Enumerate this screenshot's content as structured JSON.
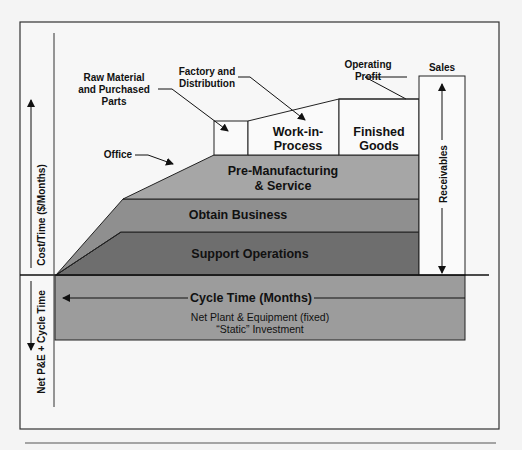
{
  "diagram": {
    "type": "cost-structure-diagram",
    "axis": {
      "upper_label": "Cost/Time ($/Months)",
      "lower_label": "Net P&E + Cycle Time"
    },
    "layers": [
      {
        "name": "Support Operations",
        "color": "#6e6e6e"
      },
      {
        "name": "Obtain Business",
        "color": "#8f8f8f"
      },
      {
        "name": "Pre-Manufacturing",
        "name_line2": "& Service",
        "color": "#a6a6a6"
      }
    ],
    "boxes": {
      "wip": {
        "line1": "Work-in-",
        "line2": "Process"
      },
      "finished": {
        "line1": "Finished",
        "line2": "Goods"
      },
      "receivables": "Receivables"
    },
    "callouts": {
      "raw_material": {
        "line1": "Raw Material",
        "line2": "and Purchased",
        "line3": "Parts"
      },
      "factory": {
        "line1": "Factory and",
        "line2": "Distribution"
      },
      "operating_profit": {
        "line1": "Operating",
        "line2": "Profit"
      },
      "sales": "Sales",
      "office": "Office"
    },
    "bottom": {
      "cycle_time": "Cycle Time (Months)",
      "line1": "Net Plant & Equipment (fixed)",
      "line2": "“Static” Investment",
      "color": "#9c9c9c"
    }
  }
}
